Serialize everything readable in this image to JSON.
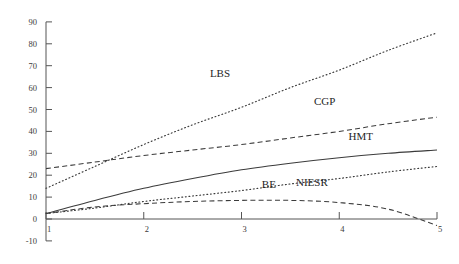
{
  "chart_data": {
    "type": "line",
    "title": "",
    "subtitle": "",
    "xlabel": "",
    "ylabel": "",
    "xlim": [
      1,
      5
    ],
    "ylim": [
      -10,
      90
    ],
    "grid": false,
    "legend_position": "inline-annotations",
    "x_ticks": [
      "1",
      "2",
      "3",
      "4",
      "5"
    ],
    "y_ticks": [
      "-10",
      "0",
      "10",
      "20",
      "30",
      "40",
      "50",
      "60",
      "70",
      "80",
      "90"
    ],
    "x": [
      1,
      1.5,
      2,
      2.5,
      3,
      3.5,
      4,
      4.5,
      5
    ],
    "series": [
      {
        "name": "LBS",
        "style": "dotted",
        "label": "LBS",
        "label_x": 2.78,
        "label_y": 65,
        "values": [
          14,
          24,
          34,
          43,
          51,
          60,
          68,
          77,
          85
        ]
      },
      {
        "name": "CGP",
        "style": "dashed",
        "label": "CGP",
        "label_x": 3.85,
        "label_y": 52,
        "values": [
          23,
          26,
          29,
          31.5,
          34,
          37,
          40,
          43.5,
          46.5
        ]
      },
      {
        "name": "HMT",
        "style": "solid",
        "label": "HMT",
        "label_x": 4.22,
        "label_y": 36,
        "values": [
          2.5,
          8.5,
          14,
          18.5,
          22.5,
          25.5,
          28,
          30,
          31.5
        ]
      },
      {
        "name": "BE",
        "style": "dotted",
        "label": "BE",
        "label_x": 3.28,
        "label_y": 14,
        "values": [
          2.5,
          5,
          8,
          10.5,
          13,
          16,
          18.5,
          21.5,
          24
        ]
      },
      {
        "name": "NIESR",
        "style": "dashed",
        "label": "NIESR",
        "label_x": 3.72,
        "label_y": 15,
        "values": [
          2.5,
          5.5,
          7,
          8,
          8.5,
          8.5,
          7.5,
          4.5,
          -3
        ]
      }
    ]
  }
}
